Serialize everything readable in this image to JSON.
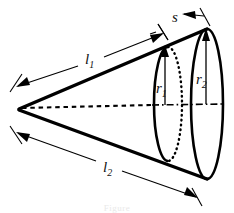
{
  "figure": {
    "type": "geometry-diagram",
    "background_color": "#ffffff",
    "ink_color": "#000000",
    "labels": {
      "slant_upper": {
        "base": "l",
        "sub": "1",
        "text": "l1"
      },
      "slant_lower": {
        "base": "l",
        "sub": "2",
        "text": "l2"
      },
      "radius_small": {
        "base": "r",
        "sub": "1",
        "text": "r1"
      },
      "radius_large": {
        "base": "r",
        "sub": "2",
        "text": "r2"
      },
      "segment_s": {
        "base": "s",
        "sub": "",
        "text": "s"
      }
    },
    "geometry": {
      "apex": {
        "x": 18,
        "y": 108
      },
      "small_ellipse": {
        "cx": 168,
        "cy": 104,
        "rx": 14,
        "ry": 57
      },
      "large_ellipse": {
        "cx": 207,
        "cy": 104,
        "rx": 16,
        "ry": 75
      },
      "axis_line_style": "dashed-to-dashdot",
      "hidden_arc_style": "dotted"
    },
    "dimensions": [
      {
        "name": "l1",
        "from": "apex",
        "to": "small-ellipse-top",
        "label": "l1"
      },
      {
        "name": "l2",
        "from": "apex",
        "to": "large-ellipse-bottom",
        "label": "l2"
      },
      {
        "name": "r1",
        "from": "axis",
        "to": "small-ellipse-top",
        "label": "r1"
      },
      {
        "name": "r2",
        "from": "axis",
        "to": "large-ellipse-top",
        "label": "r2"
      },
      {
        "name": "s",
        "from": "small-ellipse-top",
        "to": "large-ellipse-top",
        "label": "s"
      }
    ]
  },
  "caption": {
    "ghost_text": "Figure"
  }
}
